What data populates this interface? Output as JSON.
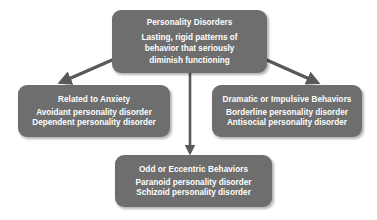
{
  "diagram": {
    "type": "flowchart",
    "background_color": "#ffffff",
    "node_fill_color": "#6e6e6e",
    "node_text_color": "#ffffff",
    "arrow_color": "#595959",
    "nodes": {
      "root": {
        "title": "Personality Disorders",
        "lines": [
          "Lasting, rigid patterns of",
          "behavior that seriously",
          "diminish functioning"
        ]
      },
      "anxiety": {
        "title": "Related to Anxiety",
        "lines": [
          "Avoidant personality disorder",
          "Dependent personality disorder"
        ]
      },
      "dramatic": {
        "title": "Dramatic or Impulsive Behaviors",
        "lines": [
          "Borderline personality disorder",
          "Antisocial personality disorder"
        ]
      },
      "odd": {
        "title": "Odd or Eccentric Behaviors",
        "lines": [
          "Paranoid personality disorder",
          "Schizoid personality disorder"
        ]
      }
    },
    "connectors": [
      {
        "name": "root-to-anxiety",
        "direction": "down-left"
      },
      {
        "name": "root-to-odd",
        "direction": "down"
      },
      {
        "name": "root-to-dramatic",
        "direction": "down-right"
      }
    ]
  }
}
